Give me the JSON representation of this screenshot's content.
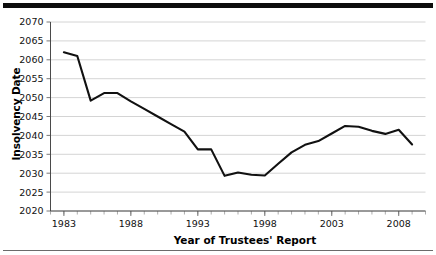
{
  "figure": {
    "top_rule": "thick-black-rule",
    "bottom_rule": "thin-gray-rule"
  },
  "chart_data": {
    "type": "line",
    "title": "",
    "xlabel": "Year of Trustees' Report",
    "ylabel": "Insolvency Date",
    "xlim": [
      1982,
      2010
    ],
    "ylim": [
      2020,
      2070
    ],
    "yticks": [
      2020,
      2025,
      2030,
      2035,
      2040,
      2045,
      2050,
      2055,
      2060,
      2065,
      2070
    ],
    "ytick_labels": [
      "2020",
      "2025",
      "2030",
      "2035",
      "2040",
      "2045",
      "2050",
      "2055",
      "2060",
      "2065",
      "2070"
    ],
    "xticks": [
      1983,
      1988,
      1993,
      1998,
      2003,
      2008
    ],
    "xtick_labels": [
      "1983",
      "1988",
      "1993",
      "1998",
      "2003",
      "2008"
    ],
    "x_minor_tick_step": 1,
    "grid": "horizontal",
    "legend": "none",
    "line_color": "#111111",
    "grid_color": "#c9c9c9",
    "x": [
      1983,
      1984,
      1985,
      1986,
      1987,
      1988,
      1989,
      1990,
      1991,
      1992,
      1993,
      1994,
      1995,
      1996,
      1997,
      1998,
      1999,
      2000,
      2001,
      2002,
      2003,
      2004,
      2005,
      2006,
      2007,
      2008,
      2009
    ],
    "values": [
      2062.0,
      2061.0,
      2049.2,
      2051.2,
      2051.2,
      2049.0,
      2047.0,
      2045.0,
      2043.0,
      2041.0,
      2036.3,
      2036.3,
      2029.3,
      2030.2,
      2029.6,
      2029.4,
      2032.5,
      2035.5,
      2037.5,
      2038.5,
      2040.5,
      2042.5,
      2042.3,
      2041.2,
      2040.4,
      2041.5,
      2037.6
    ],
    "series": [
      {
        "name": "Insolvency Date",
        "values": [
          2062.0,
          2061.0,
          2049.2,
          2051.2,
          2051.2,
          2049.0,
          2047.0,
          2045.0,
          2043.0,
          2041.0,
          2036.3,
          2036.3,
          2029.3,
          2030.2,
          2029.6,
          2029.4,
          2032.5,
          2035.5,
          2037.5,
          2038.5,
          2040.5,
          2042.5,
          2042.3,
          2041.2,
          2040.4,
          2041.5,
          2037.6
        ]
      }
    ]
  }
}
